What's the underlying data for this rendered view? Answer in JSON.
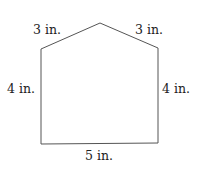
{
  "figure": {
    "shape": "pentagon",
    "labels": {
      "top_left": "3 in.",
      "top_right": "3 in.",
      "left": "4 in.",
      "right": "4 in.",
      "bottom": "5 in."
    },
    "stroke_color": "#555555"
  }
}
